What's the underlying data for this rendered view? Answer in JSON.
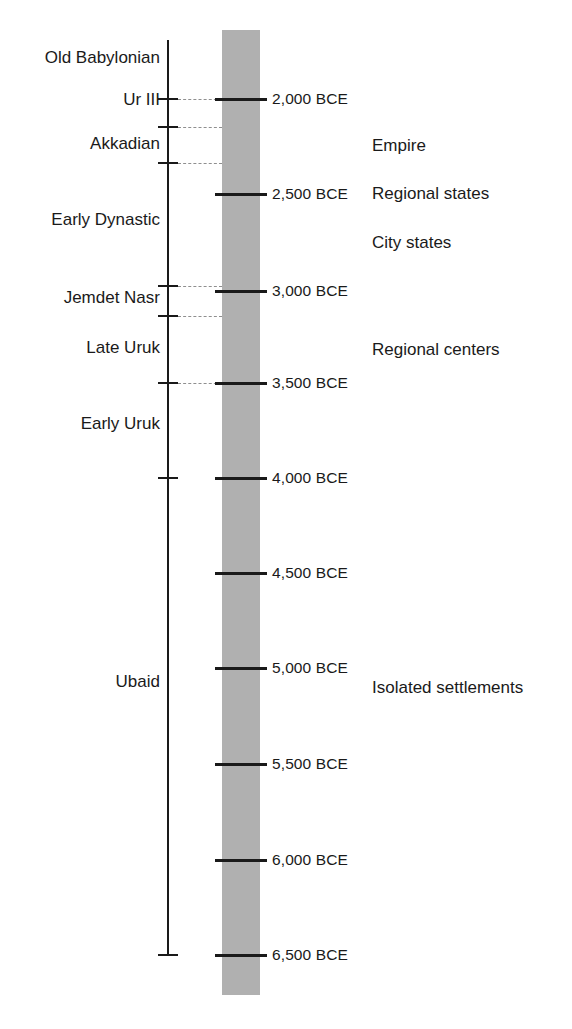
{
  "chart_data": {
    "type": "timeline",
    "xlabel": "",
    "ylabel": "Years BCE",
    "axis_orientation": "vertical",
    "axis_direction": "older downward",
    "ylim": [
      2000,
      6500
    ],
    "grid": false,
    "legend_position": "none",
    "scale_ticks": [
      {
        "label": "2,000 BCE",
        "value": 2000,
        "y": 99
      },
      {
        "label": "2,500 BCE",
        "value": 2500,
        "y": 194
      },
      {
        "label": "3,000 BCE",
        "value": 3000,
        "y": 291
      },
      {
        "label": "3,500 BCE",
        "value": 3500,
        "y": 383
      },
      {
        "label": "4,000 BCE",
        "value": 4000,
        "y": 478
      },
      {
        "label": "4,500 BCE",
        "value": 4500,
        "y": 573
      },
      {
        "label": "5,000 BCE",
        "value": 5000,
        "y": 668
      },
      {
        "label": "5,500 BCE",
        "value": 5500,
        "y": 764
      },
      {
        "label": "6,000 BCE",
        "value": 6000,
        "y": 860
      },
      {
        "label": "6,500 BCE",
        "value": 6500,
        "y": 955
      }
    ],
    "periods": [
      {
        "label": "Old Babylonian",
        "y": 58
      },
      {
        "label": "Ur III",
        "y": 100
      },
      {
        "label": "Akkadian",
        "y": 144
      },
      {
        "label": "Early Dynastic",
        "y": 220
      },
      {
        "label": "Jemdet Nasr",
        "y": 298
      },
      {
        "label": "Late Uruk",
        "y": 348
      },
      {
        "label": "Early Uruk",
        "y": 424
      },
      {
        "label": "Ubaid",
        "y": 682
      }
    ],
    "period_boundaries": [
      {
        "y": 99,
        "leader": true,
        "leader_width": 44
      },
      {
        "y": 127,
        "leader": true,
        "leader_width": 44
      },
      {
        "y": 163,
        "leader": true,
        "leader_width": 44
      },
      {
        "y": 286,
        "leader": true,
        "leader_width": 44
      },
      {
        "y": 316,
        "leader": true,
        "leader_width": 44
      },
      {
        "y": 383,
        "leader": true,
        "leader_width": 44
      },
      {
        "y": 478,
        "leader": false,
        "leader_width": 0
      }
    ],
    "annotations": [
      {
        "label": "Empire",
        "y": 146
      },
      {
        "label": "Regional states",
        "y": 194
      },
      {
        "label": "City states",
        "y": 243
      },
      {
        "label": "Regional centers",
        "y": 350
      },
      {
        "label": "Isolated settlements",
        "y": 688
      }
    ],
    "colors": {
      "band": "#b0b0b0",
      "ink": "#1a1a1a",
      "leader": "#8f8f8f",
      "background": "#ffffff"
    }
  }
}
